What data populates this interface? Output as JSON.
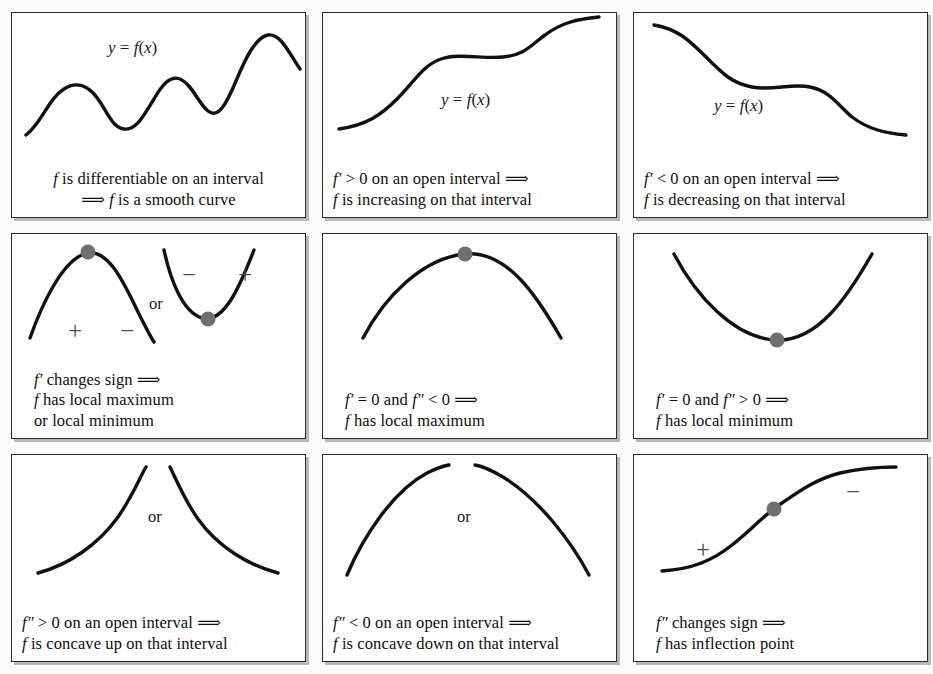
{
  "figure": {
    "background_color": "#fbfbfa",
    "panel_border_color": "#2b2b2b",
    "panel_shadow_color": "#b9b9b9",
    "curve_color": "#111111",
    "marker_color": "#6f6f6f",
    "sign_color": "#4a4a4a",
    "columns": 3,
    "rows": 3
  },
  "panels": [
    {
      "id": "differentiable-smooth",
      "curve_name": "wavy-differentiable-curve",
      "y_label": "y = f(x)",
      "or_label": "",
      "caption_line1": "f is differentiable on an interval",
      "caption_line2": "⟹ f is a smooth curve",
      "caption_line3": "",
      "signs": []
    },
    {
      "id": "increasing",
      "curve_name": "increasing-curve",
      "y_label": "y = f(x)",
      "or_label": "",
      "caption_line1": "f′ > 0 on an open interval ⟹",
      "caption_line2": "f is increasing on that interval",
      "caption_line3": "",
      "signs": []
    },
    {
      "id": "decreasing",
      "curve_name": "decreasing-curve",
      "y_label": "y = f(x)",
      "or_label": "",
      "caption_line1": "f′ < 0 on an open interval ⟹",
      "caption_line2": "f is decreasing on that interval",
      "caption_line3": "",
      "signs": []
    },
    {
      "id": "first-derivative-sign-change",
      "curve_name": "max-and-min-pair-curve",
      "y_label": "",
      "or_label": "or",
      "caption_line1": "f′ changes sign ⟹",
      "caption_line2": "f has local maximum",
      "caption_line3": "or local minimum",
      "signs": [
        "+",
        "−",
        "−",
        "+"
      ]
    },
    {
      "id": "local-maximum",
      "curve_name": "concave-down-peak-curve",
      "y_label": "",
      "or_label": "",
      "caption_line1": "f′ = 0 and f″ < 0 ⟹",
      "caption_line2": "f has local maximum",
      "caption_line3": "",
      "signs": []
    },
    {
      "id": "local-minimum",
      "curve_name": "concave-up-valley-curve",
      "y_label": "",
      "or_label": "",
      "caption_line1": "f′ = 0 and f″ > 0 ⟹",
      "caption_line2": "f has local minimum",
      "caption_line3": "",
      "signs": []
    },
    {
      "id": "concave-up",
      "curve_name": "concave-up-pair-curve",
      "y_label": "",
      "or_label": "or",
      "caption_line1": "f″ > 0 on an open interval ⟹",
      "caption_line2": "f is concave up on that interval",
      "caption_line3": "",
      "signs": []
    },
    {
      "id": "concave-down",
      "curve_name": "concave-down-pair-curve",
      "y_label": "",
      "or_label": "or",
      "caption_line1": "f″ < 0 on an open interval ⟹",
      "caption_line2": "f is concave down on that interval",
      "caption_line3": "",
      "signs": []
    },
    {
      "id": "inflection-point",
      "curve_name": "sigmoid-inflection-curve",
      "y_label": "",
      "or_label": "",
      "caption_line1": "f″ changes sign ⟹",
      "caption_line2": "f has inflection point",
      "caption_line3": "",
      "signs": [
        "+",
        "−"
      ]
    }
  ],
  "chart_data": {
    "type": "line",
    "xlabel": "",
    "ylabel": "",
    "grid": false,
    "legend": "none",
    "panels": [
      {
        "name": "f is differentiable on an interval",
        "shape": "wavy smooth curve with three local maxima and two local minima",
        "points": [
          [
            12,
            122
          ],
          [
            40,
            92
          ],
          [
            62,
            72
          ],
          [
            85,
            78
          ],
          [
            105,
            104
          ],
          [
            122,
            112
          ],
          [
            140,
            88
          ],
          [
            158,
            62
          ],
          [
            175,
            70
          ],
          [
            192,
            94
          ],
          [
            205,
            100
          ],
          [
            222,
            66
          ],
          [
            240,
            26
          ],
          [
            258,
            18
          ],
          [
            272,
            34
          ],
          [
            288,
            54
          ]
        ],
        "markers": []
      },
      {
        "name": "f' > 0 on an open interval",
        "shape": "monotone increasing curve with a flat middle plateau",
        "points": [
          [
            18,
            116
          ],
          [
            50,
            106
          ],
          [
            80,
            86
          ],
          [
            105,
            62
          ],
          [
            130,
            48
          ],
          [
            160,
            44
          ],
          [
            190,
            42
          ],
          [
            215,
            34
          ],
          [
            245,
            18
          ],
          [
            272,
            10
          ]
        ],
        "markers": []
      },
      {
        "name": "f' < 0 on an open interval",
        "shape": "monotone decreasing curve with a flat middle plateau",
        "points": [
          [
            22,
            14
          ],
          [
            52,
            24
          ],
          [
            80,
            44
          ],
          [
            105,
            60
          ],
          [
            130,
            66
          ],
          [
            160,
            68
          ],
          [
            190,
            74
          ],
          [
            215,
            88
          ],
          [
            245,
            108
          ],
          [
            272,
            116
          ]
        ],
        "markers": []
      },
      {
        "name": "f' changes sign",
        "shape": "left concave-down hump and right concave-up valley",
        "markers": [
          [
            85,
            18
          ],
          [
            198,
            100
          ]
        ],
        "sign_positions": [
          [
            58,
            88,
            "+"
          ],
          [
            110,
            88,
            "−"
          ],
          [
            162,
            40,
            "−"
          ],
          [
            218,
            40,
            "+"
          ]
        ]
      },
      {
        "name": "f' = 0 and f'' < 0",
        "shape": "single concave-down peak with marker at vertex",
        "markers": [
          [
            147,
            18
          ]
        ]
      },
      {
        "name": "f' = 0 and f'' > 0",
        "shape": "single concave-up valley with marker at vertex",
        "markers": [
          [
            147,
            104
          ]
        ]
      },
      {
        "name": "f'' > 0 on an open interval",
        "shape": "two concave-up arcs meeting near the top center",
        "markers": []
      },
      {
        "name": "f'' < 0 on an open interval",
        "shape": "two concave-down arcs meeting near the top center",
        "markers": []
      },
      {
        "name": "f'' changes sign",
        "shape": "sigmoid curve with inflection marker at center",
        "markers": [
          [
            148,
            62
          ]
        ],
        "sign_positions": [
          [
            72,
            96,
            "+"
          ],
          [
            212,
            28,
            "−"
          ]
        ]
      }
    ]
  }
}
